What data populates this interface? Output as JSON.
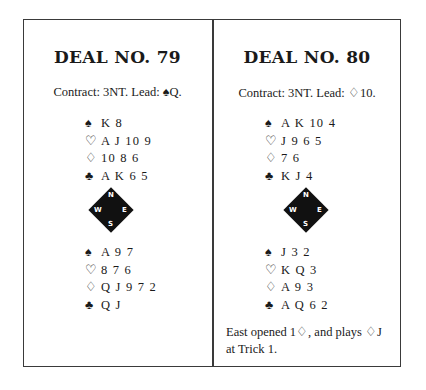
{
  "deals": [
    {
      "title": "DEAL NO. 79",
      "contract": "Contract: 3NT. Lead: ♠Q.",
      "north": {
        "spades": "♠",
        "spades_cards": "K 8",
        "hearts": "♡",
        "hearts_cards": "A J 10 9",
        "diamonds": "♢",
        "diamonds_cards": "10 8 6",
        "clubs": "♣",
        "clubs_cards": "A K 6 5"
      },
      "south": {
        "spades": "♠",
        "spades_cards": "A 9 7",
        "hearts": "♡",
        "hearts_cards": "8 7 6",
        "diamonds": "♢",
        "diamonds_cards": "Q J 9 7 2",
        "clubs": "♣",
        "clubs_cards": "Q J"
      },
      "compass": {
        "n": "N",
        "w": "W",
        "e": "E",
        "s": "S"
      }
    },
    {
      "title": "DEAL NO. 80",
      "contract": "Contract: 3NT. Lead: ♢10.",
      "north": {
        "spades": "♠",
        "spades_cards": "A K 10 4",
        "hearts": "♡",
        "hearts_cards": "J 9 6 5",
        "diamonds": "♢",
        "diamonds_cards": "7 6",
        "clubs": "♣",
        "clubs_cards": "K J 4"
      },
      "south": {
        "spades": "♠",
        "spades_cards": "J 3 2",
        "hearts": "♡",
        "hearts_cards": "K Q 3",
        "diamonds": "♢",
        "diamonds_cards": "A 9 3",
        "clubs": "♣",
        "clubs_cards": "A Q 6 2"
      },
      "compass": {
        "n": "N",
        "w": "W",
        "e": "E",
        "s": "S"
      },
      "note_line1": "East opened 1♢, and plays ♢J",
      "note_line2": "at Trick 1."
    }
  ]
}
